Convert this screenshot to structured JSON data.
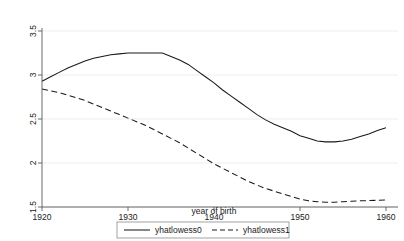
{
  "chart_data": {
    "type": "line",
    "title": "",
    "xlabel": "year of birth",
    "ylabel": "",
    "xlim": [
      1920,
      1960
    ],
    "ylim": [
      1.5,
      3.5
    ],
    "xticks": [
      1920,
      1930,
      1940,
      1950,
      1960
    ],
    "yticks": [
      1.5,
      2,
      2.5,
      3,
      3.5
    ],
    "xtick_labels": [
      "1920",
      "1930",
      "1940",
      "1950",
      "1960"
    ],
    "ytick_labels": [
      "1.5",
      "2",
      "2.5",
      "3",
      "3.5"
    ],
    "grid": "horizontal",
    "legend_position": "bottom-outside",
    "x": [
      1920,
      1921,
      1922,
      1923,
      1924,
      1925,
      1926,
      1927,
      1928,
      1929,
      1930,
      1931,
      1932,
      1933,
      1934,
      1935,
      1936,
      1937,
      1938,
      1939,
      1940,
      1941,
      1942,
      1943,
      1944,
      1945,
      1946,
      1947,
      1948,
      1949,
      1950,
      1951,
      1952,
      1953,
      1954,
      1955,
      1956,
      1957,
      1958,
      1959,
      1960
    ],
    "series": [
      {
        "name": "yhatlowess0",
        "style": "solid",
        "color": "#1a1a1a",
        "values": [
          2.93,
          2.98,
          3.03,
          3.08,
          3.12,
          3.16,
          3.19,
          3.21,
          3.23,
          3.24,
          3.25,
          3.25,
          3.25,
          3.25,
          3.25,
          3.21,
          3.17,
          3.12,
          3.05,
          2.98,
          2.91,
          2.83,
          2.76,
          2.69,
          2.62,
          2.55,
          2.49,
          2.44,
          2.4,
          2.36,
          2.31,
          2.28,
          2.25,
          2.24,
          2.24,
          2.25,
          2.27,
          2.3,
          2.33,
          2.37,
          2.4
        ]
      },
      {
        "name": "yhatlowess1",
        "style": "dashed",
        "color": "#1a1a1a",
        "values": [
          2.84,
          2.82,
          2.8,
          2.77,
          2.74,
          2.71,
          2.67,
          2.63,
          2.59,
          2.55,
          2.51,
          2.47,
          2.43,
          2.38,
          2.33,
          2.28,
          2.23,
          2.17,
          2.11,
          2.05,
          1.99,
          1.94,
          1.89,
          1.84,
          1.79,
          1.75,
          1.71,
          1.68,
          1.65,
          1.62,
          1.59,
          1.57,
          1.56,
          1.555,
          1.555,
          1.56,
          1.565,
          1.57,
          1.573,
          1.576,
          1.58
        ]
      }
    ],
    "legend": [
      {
        "label": "yhatlowess0",
        "style": "solid"
      },
      {
        "label": "yhatlowess1",
        "style": "dashed"
      }
    ]
  }
}
